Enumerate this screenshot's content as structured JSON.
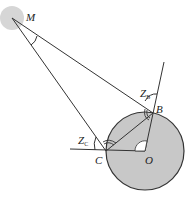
{
  "diagram": {
    "type": "geometry",
    "colors": {
      "line": "#333333",
      "circle_fill": "#c8c8c8",
      "moon_fill": "#d6d6d6",
      "background": "#ffffff"
    },
    "points": {
      "M": {
        "label": "M",
        "x": 12,
        "y": 18
      },
      "B": {
        "label": "B",
        "x": 153,
        "y": 113
      },
      "C": {
        "label": "C",
        "x": 106,
        "y": 151
      },
      "O": {
        "label": "O",
        "x": 149,
        "y": 151
      }
    },
    "circle": {
      "center": "O",
      "radius": 39
    },
    "angles": {
      "ZB": {
        "label": "Z",
        "subscript": "B"
      },
      "ZC": {
        "label": "Z",
        "subscript": "C"
      }
    }
  }
}
